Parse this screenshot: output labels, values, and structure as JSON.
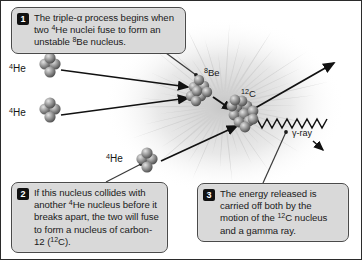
{
  "figure": {
    "background_color": "#ffffff",
    "border_color": "#2b2b2b",
    "burst_color": "#cfcfcf",
    "callout_fill": "#d9d9d9",
    "callout_border": "#4a4a4a",
    "badge_fill": "#111111",
    "text_color": "#1a1a1a"
  },
  "callouts": [
    {
      "number": "1",
      "text_runs": [
        {
          "t": "The triple-α process begins when two "
        },
        {
          "t": "4",
          "sup": true
        },
        {
          "t": "He nuclei fuse to form an unstable "
        },
        {
          "t": "8",
          "sup": true
        },
        {
          "t": "Be nucleus."
        }
      ],
      "plain": "The triple-α process begins when two 4He nuclei fuse to form an unstable 8Be nucleus."
    },
    {
      "number": "2",
      "text_runs": [
        {
          "t": "If this nucleus collides with another "
        },
        {
          "t": "4",
          "sup": true
        },
        {
          "t": "He nucleus before it breaks apart, the two will fuse to form a nucleus of carbon-12 ("
        },
        {
          "t": "12",
          "sup": true
        },
        {
          "t": "C)."
        }
      ],
      "plain": "If this nucleus collides with another 4He nucleus before it breaks apart, the two will fuse to form a nucleus of carbon-12 (12C)."
    },
    {
      "number": "3",
      "text_runs": [
        {
          "t": "The energy released is carried off both by the motion of the "
        },
        {
          "t": "12",
          "sup": true
        },
        {
          "t": "C nucleus and a gamma ray."
        }
      ],
      "plain": "The energy released is carried off both by the motion of the 12C nucleus and a gamma ray."
    }
  ],
  "labels": {
    "helium_1": {
      "mass": "4",
      "symbol": "He"
    },
    "helium_2": {
      "mass": "4",
      "symbol": "He"
    },
    "helium_3": {
      "mass": "4",
      "symbol": "He"
    },
    "beryllium": {
      "mass": "8",
      "symbol": "Be"
    },
    "carbon": {
      "mass": "12",
      "symbol": "C"
    },
    "gamma_ray": "γ-ray"
  },
  "nuclei": [
    {
      "name": "helium-4-upper",
      "nucleon_count": 4,
      "label": "4He"
    },
    {
      "name": "helium-4-lower",
      "nucleon_count": 4,
      "label": "4He"
    },
    {
      "name": "helium-4-third",
      "nucleon_count": 4,
      "label": "4He"
    },
    {
      "name": "beryllium-8",
      "nucleon_count": 8,
      "label": "8Be"
    },
    {
      "name": "carbon-12",
      "nucleon_count": 12,
      "label": "12C"
    }
  ],
  "arrows": [
    {
      "name": "he1-to-be",
      "from": "helium-4-upper",
      "to": "beryllium-8"
    },
    {
      "name": "he2-to-be",
      "from": "helium-4-lower",
      "to": "beryllium-8"
    },
    {
      "name": "be-to-c12",
      "from": "beryllium-8",
      "to": "carbon-12"
    },
    {
      "name": "he3-to-c12",
      "from": "helium-4-third",
      "to": "carbon-12"
    },
    {
      "name": "c12-recoil",
      "from": "carbon-12",
      "to": "upper-right"
    },
    {
      "name": "gamma-ray-wave",
      "from": "carbon-12",
      "to": "lower-right"
    }
  ]
}
